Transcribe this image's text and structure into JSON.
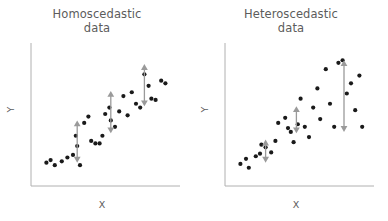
{
  "figure": {
    "background": "#ffffff",
    "dot_color": "#1a1a1a",
    "arrow_color": "#9a9a9a",
    "axis_color": "#b0b0b0",
    "text_color": "#5c5c5c"
  },
  "panels": [
    {
      "id": "homoscedastic",
      "title_line1": "Homoscedastic",
      "title_line2": "data",
      "xlabel": "X",
      "ylabel": "Y"
    },
    {
      "id": "heteroscedastic",
      "title_line1": "Heteroscedastic",
      "title_line2": "data",
      "xlabel": "X",
      "ylabel": "Y"
    }
  ],
  "chart_data": [
    {
      "type": "scatter",
      "title": "Homoscedastic data",
      "xlabel": "X",
      "ylabel": "Y",
      "xlim": [
        0,
        100
      ],
      "ylim": [
        0,
        100
      ],
      "grid": false,
      "legend": null,
      "axis_ticks": [],
      "points": [
        [
          6,
          12
        ],
        [
          9,
          14
        ],
        [
          12,
          10
        ],
        [
          17,
          13
        ],
        [
          21,
          16
        ],
        [
          25,
          18
        ],
        [
          27,
          33
        ],
        [
          28,
          25
        ],
        [
          30,
          10
        ],
        [
          33,
          43
        ],
        [
          36,
          48
        ],
        [
          38,
          29
        ],
        [
          41,
          27
        ],
        [
          44,
          27
        ],
        [
          46,
          33
        ],
        [
          48,
          50
        ],
        [
          51,
          55
        ],
        [
          52,
          45
        ],
        [
          55,
          40
        ],
        [
          58,
          52
        ],
        [
          61,
          64
        ],
        [
          64,
          49
        ],
        [
          67,
          67
        ],
        [
          70,
          58
        ],
        [
          73,
          55
        ],
        [
          76,
          81
        ],
        [
          79,
          72
        ],
        [
          81,
          62
        ],
        [
          84,
          61
        ],
        [
          88,
          76
        ],
        [
          91,
          74
        ]
      ],
      "annotations": [
        {
          "type": "double-arrow",
          "x": 28,
          "y_top": 45,
          "y_bottom": 12,
          "length": 33,
          "note": "constant spread"
        },
        {
          "type": "double-arrow",
          "x": 52,
          "y_top": 68,
          "y_bottom": 35,
          "length": 33,
          "note": "constant spread"
        },
        {
          "type": "double-arrow",
          "x": 76,
          "y_top": 89,
          "y_bottom": 56,
          "length": 33,
          "note": "constant spread"
        }
      ]
    },
    {
      "type": "scatter",
      "title": "Heteroscedastic data",
      "xlabel": "X",
      "ylabel": "Y",
      "xlim": [
        0,
        100
      ],
      "ylim": [
        0,
        100
      ],
      "grid": false,
      "legend": null,
      "axis_ticks": [],
      "points": [
        [
          6,
          11
        ],
        [
          10,
          15
        ],
        [
          12,
          8
        ],
        [
          17,
          17
        ],
        [
          20,
          19
        ],
        [
          21,
          26
        ],
        [
          24,
          24
        ],
        [
          28,
          20
        ],
        [
          31,
          29
        ],
        [
          33,
          43
        ],
        [
          38,
          47
        ],
        [
          40,
          39
        ],
        [
          42,
          36
        ],
        [
          44,
          28
        ],
        [
          47,
          42
        ],
        [
          49,
          62
        ],
        [
          52,
          40
        ],
        [
          55,
          32
        ],
        [
          58,
          55
        ],
        [
          61,
          70
        ],
        [
          63,
          46
        ],
        [
          67,
          85
        ],
        [
          70,
          58
        ],
        [
          73,
          40
        ],
        [
          76,
          90
        ],
        [
          79,
          92
        ],
        [
          82,
          66
        ],
        [
          85,
          74
        ],
        [
          88,
          53
        ],
        [
          91,
          80
        ],
        [
          93,
          40
        ]
      ],
      "annotations": [
        {
          "type": "double-arrow",
          "x": 24,
          "y_top": 30,
          "y_bottom": 12,
          "length": 18,
          "note": "small spread"
        },
        {
          "type": "double-arrow",
          "x": 46,
          "y_top": 56,
          "y_bottom": 35,
          "length": 21,
          "note": "medium spread"
        },
        {
          "type": "double-arrow",
          "x": 80,
          "y_top": 92,
          "y_bottom": 36,
          "length": 56,
          "note": "large spread"
        }
      ]
    }
  ]
}
